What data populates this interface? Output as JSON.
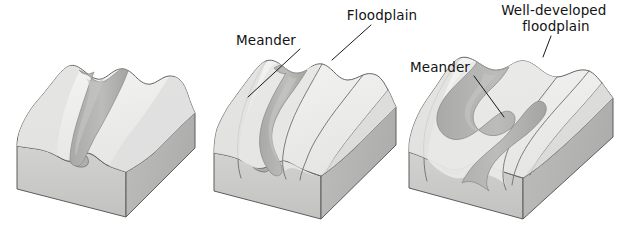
{
  "figure": {
    "background_color": "#ffffff",
    "width": 622,
    "height": 230
  },
  "palette": {
    "top_surface": "#ececeb",
    "top_surface_light": "#f2f2f1",
    "valley_slope": "#e0e0df",
    "front_face": "#c9c9c8",
    "side_face": "#b9b9b8",
    "river_channel": "#b4b4b3",
    "river_channel_dark": "#a6a6a5",
    "outline": "#595959",
    "label_text": "#131313",
    "leader_line": "#1a1a1a"
  },
  "blocks": [
    {
      "id": "stage-1",
      "stage": 1,
      "name": "narrow-v-shaped-valley",
      "description": "Young stream in a narrow V-shaped valley with no floodplain",
      "labels": []
    },
    {
      "id": "stage-2",
      "stage": 2,
      "name": "meandering-stream-with-floodplain",
      "description": "Stream begins to meander and a narrow floodplain forms",
      "labels": [
        {
          "id": "meander-2",
          "text": "Meander",
          "lines": [
            "Meander"
          ],
          "anchor": "end",
          "text_x": 296,
          "text_y": 45,
          "leader": {
            "x1": 300,
            "y1": 49,
            "x2": 248,
            "y2": 97
          }
        },
        {
          "id": "floodplain-2",
          "text": "Floodplain",
          "lines": [
            "Floodplain"
          ],
          "anchor": "middle",
          "text_x": 382,
          "text_y": 20,
          "leader": {
            "x1": 371,
            "y1": 25,
            "x2": 332,
            "y2": 60
          }
        }
      ]
    },
    {
      "id": "stage-3",
      "stage": 3,
      "name": "wide-meander-belt-with-well-developed-floodplain",
      "description": "Broad meander belt across a wide, well-developed floodplain",
      "labels": [
        {
          "id": "meander-3",
          "text": "Meander",
          "lines": [
            "Meander"
          ],
          "anchor": "end",
          "text_x": 470,
          "text_y": 72,
          "leader": {
            "x1": 474,
            "y1": 76,
            "x2": 504,
            "y2": 117
          }
        },
        {
          "id": "well-developed-floodplain-3",
          "text": "Well-developed floodplain",
          "lines": [
            "Well-developed",
            "floodplain"
          ],
          "anchor": "middle",
          "text_x": 556,
          "text_y": 15,
          "line_height": 16,
          "leader": {
            "x1": 551,
            "y1": 36,
            "x2": 543,
            "y2": 57
          }
        }
      ]
    }
  ]
}
